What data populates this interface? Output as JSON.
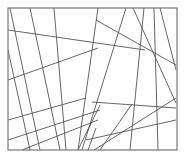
{
  "diagram": {
    "type": "line-composition",
    "width": 184,
    "height": 157,
    "stroke_color": "#555555",
    "frame_color": "#777777",
    "background": "#ffffff",
    "frame": {
      "x1": 8,
      "y1": 8,
      "x2": 177,
      "y2": 150
    },
    "lines": [
      [
        10,
        8,
        40,
        150
      ],
      [
        8,
        30,
        145,
        50
      ],
      [
        54,
        8,
        66,
        150
      ],
      [
        8,
        80,
        98,
        48
      ],
      [
        8,
        50,
        30,
        150
      ],
      [
        22,
        150,
        98,
        120
      ],
      [
        8,
        120,
        86,
        98
      ],
      [
        8,
        140,
        100,
        110
      ],
      [
        98,
        8,
        78,
        150
      ],
      [
        126,
        8,
        82,
        150
      ],
      [
        133,
        8,
        176,
        103
      ],
      [
        144,
        8,
        130,
        150
      ],
      [
        154,
        8,
        158,
        150
      ],
      [
        160,
        8,
        176,
        70
      ],
      [
        96,
        20,
        176,
        65
      ],
      [
        92,
        102,
        176,
        108
      ],
      [
        86,
        140,
        176,
        120
      ],
      [
        94,
        150,
        176,
        98
      ],
      [
        78,
        150,
        100,
        105
      ],
      [
        100,
        150,
        132,
        104
      ],
      [
        88,
        150,
        96,
        128
      ],
      [
        30,
        8,
        60,
        150
      ]
    ]
  }
}
